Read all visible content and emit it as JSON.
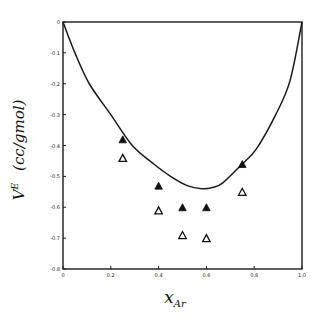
{
  "chart_data": {
    "type": "scatter",
    "title": "",
    "xlabel": "x_Ar",
    "xlabel_main": "x",
    "xlabel_sub": "Ar",
    "ylabel": "V^E (cc/gmol)",
    "ylabel_main": "V",
    "ylabel_sup": "E",
    "ylabel_units": "(cc/gmol)",
    "xlim": [
      0,
      1.0
    ],
    "ylim": [
      -0.8,
      0
    ],
    "grid": false,
    "legend": "none",
    "x_ticks": [
      0,
      0.2,
      0.4,
      0.6,
      0.8,
      1.0
    ],
    "x_tick_labels": [
      "0",
      "0.2",
      "0.4",
      "0.6",
      "0.8",
      "1.0"
    ],
    "y_ticks": [
      0,
      -0.1,
      -0.2,
      -0.3,
      -0.4,
      -0.5,
      -0.6,
      -0.7,
      -0.8
    ],
    "y_tick_labels": [
      "0",
      "-0.1",
      "-0.2",
      "-0.3",
      "-0.4",
      "-0.5",
      "-0.6",
      "-0.7",
      "-0.8"
    ],
    "series": [
      {
        "name": "curve",
        "type": "line",
        "color": "#1a1a1a",
        "x": [
          0.0,
          0.05,
          0.11,
          0.2,
          0.29,
          0.38,
          0.45,
          0.52,
          0.58,
          0.63,
          0.67,
          0.75,
          0.81,
          0.89,
          0.95,
          1.0
        ],
        "y": [
          0.0,
          -0.1,
          -0.2,
          -0.3,
          -0.4,
          -0.46,
          -0.5,
          -0.53,
          -0.54,
          -0.535,
          -0.52,
          -0.46,
          -0.41,
          -0.3,
          -0.19,
          0.0
        ]
      },
      {
        "name": "filled triangles",
        "type": "scatter",
        "marker": "filled-triangle",
        "color": "#111111",
        "x": [
          0.25,
          0.4,
          0.5,
          0.6,
          0.75
        ],
        "y": [
          -0.38,
          -0.53,
          -0.6,
          -0.6,
          -0.46
        ]
      },
      {
        "name": "open triangles",
        "type": "scatter",
        "marker": "open-triangle",
        "color": "#111111",
        "x": [
          0.25,
          0.4,
          0.5,
          0.6,
          0.75
        ],
        "y": [
          -0.44,
          -0.61,
          -0.69,
          -0.7,
          -0.55
        ]
      }
    ]
  }
}
